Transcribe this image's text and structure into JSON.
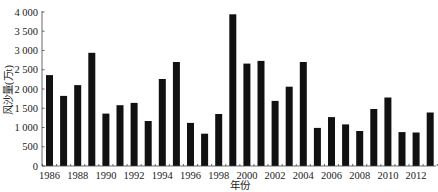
{
  "chart_data": {
    "type": "bar",
    "title": "",
    "xlabel": "年份",
    "ylabel": "风沙量(万t)",
    "ylim": [
      0,
      4000
    ],
    "yticks": [
      0,
      500,
      1000,
      1500,
      2000,
      2500,
      3000,
      3500,
      4000
    ],
    "ytick_labels": [
      "0",
      "500",
      "1 000",
      "1 500",
      "2 000",
      "2 500",
      "3 000",
      "3 500",
      "4 000"
    ],
    "xtick_labels": [
      "1986",
      "1988",
      "1990",
      "1992",
      "1994",
      "1996",
      "1998",
      "2000",
      "2002",
      "2004",
      "2006",
      "2008",
      "2010",
      "2012"
    ],
    "grid": false,
    "legend": null,
    "bar_color": "#111111",
    "categories": [
      "1986",
      "1987",
      "1988",
      "1989",
      "1990",
      "1991",
      "1992",
      "1993",
      "1994",
      "1995",
      "1996",
      "1997",
      "1998",
      "1999",
      "2000",
      "2001",
      "2002",
      "2003",
      "2004",
      "2005",
      "2006",
      "2007",
      "2008",
      "2009",
      "2010",
      "2011",
      "2012",
      "2013"
    ],
    "values": [
      2360,
      1820,
      2100,
      2940,
      1360,
      1580,
      1640,
      1170,
      2260,
      2700,
      1120,
      840,
      1350,
      3940,
      2660,
      2730,
      1690,
      2060,
      2700,
      990,
      1270,
      1080,
      910,
      1480,
      1780,
      880,
      870,
      1390
    ]
  }
}
